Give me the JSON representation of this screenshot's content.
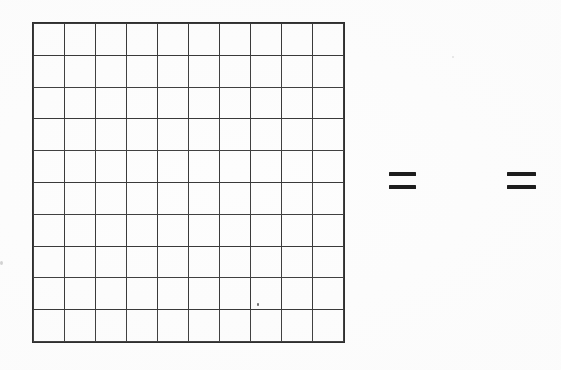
{
  "page": {
    "background_color": "#fdfdfd",
    "width": 561,
    "height": 370
  },
  "grid": {
    "name": "ten-by-ten-grid",
    "rows": 10,
    "columns": 10,
    "total_cells": 100,
    "cell_contents": [
      [
        "",
        "",
        "",
        "",
        "",
        "",
        "",
        "",
        "",
        ""
      ],
      [
        "",
        "",
        "",
        "",
        "",
        "",
        "",
        "",
        "",
        ""
      ],
      [
        "",
        "",
        "",
        "",
        "",
        "",
        "",
        "",
        "",
        ""
      ],
      [
        "",
        "",
        "",
        "",
        "",
        "",
        "",
        "",
        "",
        ""
      ],
      [
        "",
        "",
        "",
        "",
        "",
        "",
        "",
        "",
        "",
        ""
      ],
      [
        "",
        "",
        "",
        "",
        "",
        "",
        "",
        "",
        "",
        ""
      ],
      [
        "",
        "",
        "",
        "",
        "",
        "",
        "",
        "",
        "",
        ""
      ],
      [
        "",
        "",
        "",
        "",
        "",
        "",
        "",
        "",
        "",
        ""
      ],
      [
        "",
        "",
        "",
        "",
        "",
        "",
        "",
        "",
        "",
        ""
      ],
      [
        "",
        "",
        "",
        "",
        "",
        "",
        "",
        "",
        "",
        ""
      ]
    ],
    "line_color": "#3b3b3b",
    "frame_color": "#2f2f2f",
    "fill_color": "transparent"
  },
  "symbols": [
    {
      "name": "equals-sign-1",
      "glyph": "=",
      "color": "#1d1d1d"
    },
    {
      "name": "equals-sign-2",
      "glyph": "=",
      "color": "#1d1d1d"
    }
  ],
  "artifacts": [
    {
      "name": "speck-grid",
      "color": "#6f6f6f"
    },
    {
      "name": "speck-left-edge",
      "color": "#d2d2d2"
    },
    {
      "name": "speck-top-right",
      "color": "#e2e2e2"
    }
  ]
}
